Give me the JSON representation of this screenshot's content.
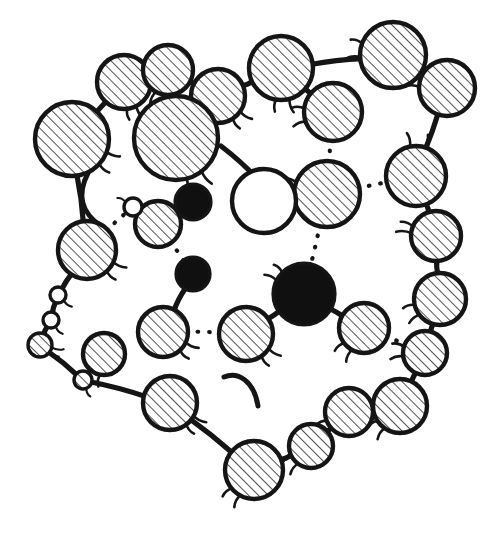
{
  "figure": {
    "title": "",
    "caption": "",
    "background_color": "#ffffff",
    "ink_color": "#151515",
    "fill_hatched": "#ffffff",
    "fill_solid": "#101010",
    "fill_open": "#ffffff",
    "hatch_angle_deg": 45,
    "style": "hand-drawn line illustration"
  },
  "chart_data": {
    "type": "diagram",
    "title": "",
    "node_styles": [
      "hatched",
      "solid",
      "open"
    ],
    "link_styles": [
      "solid",
      "dotted",
      "arc"
    ],
    "counts": {
      "hatched_nodes": 31,
      "solid_nodes": 3,
      "open_nodes": 3,
      "solid_links": 30,
      "dotted_links": 8,
      "free_arcs": 3
    },
    "nodes": [
      {
        "id": "n01",
        "x": 72,
        "y": 139,
        "r": 37,
        "style": "hatched",
        "hooks": [
          {
            "a": 20,
            "len": 14
          },
          {
            "a": 42,
            "len": 13
          }
        ]
      },
      {
        "id": "n02",
        "x": 124,
        "y": 82,
        "r": 27,
        "style": "hatched",
        "hooks": [
          {
            "a": 62,
            "len": 13
          },
          {
            "a": 82,
            "len": 11
          }
        ]
      },
      {
        "id": "n03",
        "x": 168,
        "y": 70,
        "r": 25,
        "style": "hatched",
        "hooks": [
          {
            "a": 118,
            "len": 13
          }
        ]
      },
      {
        "id": "n04",
        "x": 218,
        "y": 96,
        "r": 27,
        "style": "hatched",
        "hooks": [
          {
            "a": 34,
            "len": 14
          },
          {
            "a": 56,
            "len": 12
          }
        ]
      },
      {
        "id": "n05",
        "x": 281,
        "y": 68,
        "r": 32,
        "style": "hatched",
        "hooks": [
          {
            "a": 74,
            "len": 14
          },
          {
            "a": 98,
            "len": 12
          }
        ]
      },
      {
        "id": "n06",
        "x": 333,
        "y": 112,
        "r": 29,
        "style": "hatched",
        "hooks": [
          {
            "a": 160,
            "len": 13
          },
          {
            "a": 186,
            "len": 12
          }
        ]
      },
      {
        "id": "n07",
        "x": 393,
        "y": 55,
        "r": 33,
        "style": "hatched",
        "hooks": [
          {
            "a": 176,
            "len": 14
          },
          {
            "a": 200,
            "len": 12
          }
        ]
      },
      {
        "id": "n08",
        "x": 447,
        "y": 88,
        "r": 28,
        "style": "hatched",
        "hooks": [
          {
            "a": 182,
            "len": 14
          },
          {
            "a": 204,
            "len": 12
          }
        ]
      },
      {
        "id": "n09",
        "x": 416,
        "y": 176,
        "r": 30,
        "style": "hatched",
        "hooks": [
          {
            "a": 258,
            "len": 14
          },
          {
            "a": 286,
            "len": 13
          }
        ]
      },
      {
        "id": "n10",
        "x": 436,
        "y": 236,
        "r": 25,
        "style": "hatched",
        "hooks": [
          {
            "a": 186,
            "len": 15
          },
          {
            "a": 202,
            "len": 13
          }
        ]
      },
      {
        "id": "n11",
        "x": 440,
        "y": 299,
        "r": 26,
        "style": "hatched",
        "hooks": [
          {
            "a": 142,
            "len": 13
          },
          {
            "a": 166,
            "len": 12
          }
        ]
      },
      {
        "id": "n12",
        "x": 425,
        "y": 353,
        "r": 22,
        "style": "hatched",
        "hooks": [
          {
            "a": 170,
            "len": 13
          },
          {
            "a": 196,
            "len": 12
          }
        ]
      },
      {
        "id": "n13",
        "x": 400,
        "y": 406,
        "r": 27,
        "style": "hatched",
        "hooks": [
          {
            "a": 124,
            "len": 13
          },
          {
            "a": 146,
            "len": 12
          }
        ]
      },
      {
        "id": "n14",
        "x": 349,
        "y": 412,
        "r": 24,
        "style": "hatched",
        "hooks": [
          {
            "a": 136,
            "len": 13
          },
          {
            "a": 158,
            "len": 12
          }
        ]
      },
      {
        "id": "n15",
        "x": 311,
        "y": 446,
        "r": 22,
        "style": "hatched",
        "hooks": [
          {
            "a": 126,
            "len": 13
          },
          {
            "a": 150,
            "len": 11
          }
        ]
      },
      {
        "id": "n16",
        "x": 254,
        "y": 470,
        "r": 29,
        "style": "hatched",
        "hooks": [
          {
            "a": 118,
            "len": 13
          },
          {
            "a": 140,
            "len": 12
          }
        ]
      },
      {
        "id": "n17",
        "x": 170,
        "y": 403,
        "r": 27,
        "style": "hatched",
        "hooks": [
          {
            "a": 28,
            "len": 14
          },
          {
            "a": 52,
            "len": 12
          }
        ]
      },
      {
        "id": "n18",
        "x": 83,
        "y": 380,
        "r": 9,
        "style": "hatched",
        "hooks": [
          {
            "a": 66,
            "len": 9
          }
        ]
      },
      {
        "id": "n19",
        "x": 40,
        "y": 345,
        "r": 12,
        "style": "hatched",
        "hooks": [
          {
            "a": 10,
            "len": 12
          },
          {
            "a": 32,
            "len": 10
          }
        ]
      },
      {
        "id": "n20",
        "x": 51,
        "y": 320,
        "r": 8,
        "style": "open",
        "hooks": [
          {
            "a": 50,
            "len": 10
          }
        ]
      },
      {
        "id": "n21",
        "x": 58,
        "y": 295,
        "r": 8,
        "style": "open",
        "hooks": [
          {
            "a": 40,
            "len": 10
          }
        ]
      },
      {
        "id": "n22",
        "x": 87,
        "y": 250,
        "r": 29,
        "style": "hatched",
        "hooks": [
          {
            "a": 24,
            "len": 14
          },
          {
            "a": 46,
            "len": 12
          }
        ]
      },
      {
        "id": "n23",
        "x": 104,
        "y": 354,
        "r": 21,
        "style": "hatched",
        "hooks": [
          {
            "a": 100,
            "len": 12
          }
        ]
      },
      {
        "id": "n24",
        "x": 163,
        "y": 332,
        "r": 25,
        "style": "hatched",
        "hooks": [
          {
            "a": 24,
            "len": 14
          },
          {
            "a": 46,
            "len": 12
          }
        ]
      },
      {
        "id": "n25",
        "x": 193,
        "y": 274,
        "r": 17,
        "style": "solid",
        "hooks": []
      },
      {
        "id": "n26",
        "x": 158,
        "y": 224,
        "r": 23,
        "style": "hatched",
        "hooks": [
          {
            "a": 200,
            "len": 12
          }
        ]
      },
      {
        "id": "n27",
        "x": 133,
        "y": 207,
        "r": 9,
        "style": "open",
        "hooks": [
          {
            "a": 210,
            "len": 9
          }
        ]
      },
      {
        "id": "n28",
        "x": 176,
        "y": 138,
        "r": 42,
        "style": "hatched",
        "hooks": [
          {
            "a": 52,
            "len": 16
          },
          {
            "a": 74,
            "len": 14
          }
        ]
      },
      {
        "id": "n29",
        "x": 193,
        "y": 202,
        "r": 18,
        "style": "solid",
        "hooks": []
      },
      {
        "id": "n30",
        "x": 246,
        "y": 334,
        "r": 27,
        "style": "hatched",
        "hooks": [
          {
            "a": 32,
            "len": 14
          },
          {
            "a": 54,
            "len": 12
          }
        ]
      },
      {
        "id": "n31",
        "x": 304,
        "y": 294,
        "r": 31,
        "style": "solid",
        "hooks": [
          {
            "a": 206,
            "len": 13
          },
          {
            "a": 224,
            "len": 11
          }
        ]
      },
      {
        "id": "n32",
        "x": 364,
        "y": 328,
        "r": 25,
        "style": "hatched",
        "hooks": [
          {
            "a": 118,
            "len": 13
          },
          {
            "a": 142,
            "len": 12
          }
        ]
      },
      {
        "id": "n33",
        "x": 327,
        "y": 194,
        "r": 33,
        "style": "hatched",
        "hooks": [
          {
            "a": 176,
            "len": 14
          },
          {
            "a": 200,
            "len": 12
          }
        ]
      },
      {
        "id": "n34",
        "x": 264,
        "y": 201,
        "r": 32,
        "style": "open",
        "hooks": []
      }
    ],
    "links": [
      {
        "from": "n01",
        "to": "n02",
        "style": "solid"
      },
      {
        "from": "n02",
        "to": "n03",
        "style": "solid"
      },
      {
        "from": "n03",
        "to": "n04",
        "style": "solid"
      },
      {
        "from": "n04",
        "to": "n05",
        "style": "solid"
      },
      {
        "from": "n05",
        "to": "n06",
        "style": "solid"
      },
      {
        "from": "n05",
        "to": "n07",
        "style": "solid"
      },
      {
        "from": "n07",
        "to": "n08",
        "style": "solid"
      },
      {
        "from": "n08",
        "to": "n09",
        "style": "solid"
      },
      {
        "from": "n09",
        "to": "n10",
        "style": "solid"
      },
      {
        "from": "n10",
        "to": "n11",
        "style": "solid"
      },
      {
        "from": "n11",
        "to": "n12",
        "style": "solid"
      },
      {
        "from": "n12",
        "to": "n13",
        "style": "solid"
      },
      {
        "from": "n13",
        "to": "n14",
        "style": "solid"
      },
      {
        "from": "n14",
        "to": "n15",
        "style": "solid"
      },
      {
        "from": "n15",
        "to": "n16",
        "style": "solid"
      },
      {
        "from": "n16",
        "to": "n17",
        "style": "solid"
      },
      {
        "from": "n17",
        "to": "n18",
        "style": "solid"
      },
      {
        "from": "n18",
        "to": "n19",
        "style": "solid"
      },
      {
        "from": "n19",
        "to": "n20",
        "style": "solid"
      },
      {
        "from": "n20",
        "to": "n21",
        "style": "solid"
      },
      {
        "from": "n21",
        "to": "n22",
        "style": "solid"
      },
      {
        "from": "n22",
        "to": "n01",
        "style": "solid"
      },
      {
        "from": "n25",
        "to": "n24",
        "style": "solid"
      },
      {
        "from": "n31",
        "to": "n30",
        "style": "solid"
      },
      {
        "from": "n31",
        "to": "n32",
        "style": "solid"
      },
      {
        "from": "n33",
        "to": "n34",
        "style": "solid"
      },
      {
        "from": "n06",
        "to": "n33",
        "style": "dotted"
      },
      {
        "from": "n33",
        "to": "n09",
        "style": "dotted"
      },
      {
        "from": "n33",
        "to": "n31",
        "style": "dotted"
      },
      {
        "from": "n22",
        "to": "n27",
        "style": "dotted"
      },
      {
        "from": "n27",
        "to": "n26",
        "style": "dotted"
      },
      {
        "from": "n26",
        "to": "n25",
        "style": "dotted"
      },
      {
        "from": "n24",
        "to": "n30",
        "style": "dotted"
      },
      {
        "from": "n32",
        "to": "n12",
        "style": "dotted"
      }
    ],
    "arcs": [
      {
        "id": "a1",
        "d": "M 221 146 C 252 170 264 186 270 196",
        "style": "solid"
      },
      {
        "id": "a2",
        "d": "M 224 377 C 238 371 254 381 258 406",
        "style": "solid"
      },
      {
        "id": "a3",
        "d": "M 88 173 C 76 196 83 214 101 226",
        "style": "solid"
      }
    ]
  }
}
